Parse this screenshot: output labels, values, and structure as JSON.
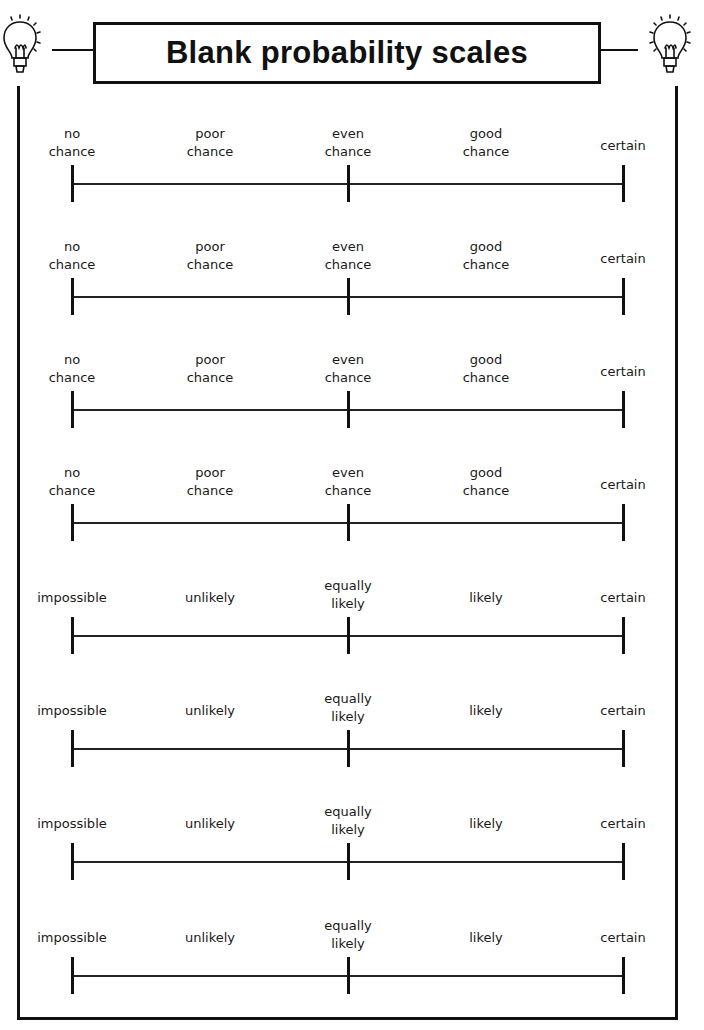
{
  "title": "Blank probability scales",
  "icons": {
    "left": "lightbulb-icon",
    "right": "lightbulb-icon"
  },
  "scales": [
    {
      "labels": [
        "no\nchance",
        "poor\nchance",
        "even\nchance",
        "good\nchance",
        "certain"
      ]
    },
    {
      "labels": [
        "no\nchance",
        "poor\nchance",
        "even\nchance",
        "good\nchance",
        "certain"
      ]
    },
    {
      "labels": [
        "no\nchance",
        "poor\nchance",
        "even\nchance",
        "good\nchance",
        "certain"
      ]
    },
    {
      "labels": [
        "no\nchance",
        "poor\nchance",
        "even\nchance",
        "good\nchance",
        "certain"
      ]
    },
    {
      "labels": [
        "impossible",
        "unlikely",
        "equally\nlikely",
        "likely",
        "certain"
      ]
    },
    {
      "labels": [
        "impossible",
        "unlikely",
        "equally\nlikely",
        "likely",
        "certain"
      ]
    },
    {
      "labels": [
        "impossible",
        "unlikely",
        "equally\nlikely",
        "likely",
        "certain"
      ]
    },
    {
      "labels": [
        "impossible",
        "unlikely",
        "equally\nlikely",
        "likely",
        "certain"
      ]
    }
  ],
  "colors": {
    "ink": "#111111",
    "paper": "#ffffff"
  }
}
